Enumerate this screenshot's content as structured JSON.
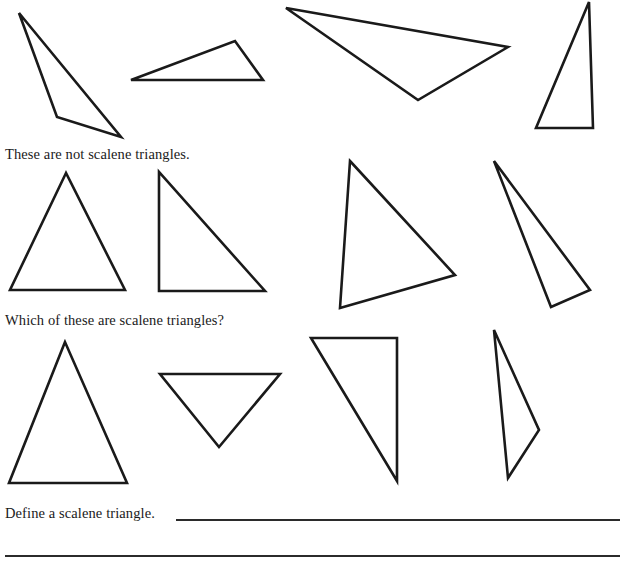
{
  "page": {
    "background_color": "#ffffff",
    "ink_color": "#1a1a1a",
    "width": 625,
    "height": 568
  },
  "prompts": {
    "not_scalene": "These are not scalene triangles.",
    "which_scalene": "Which of these are scalene triangles?",
    "define": "Define a scalene triangle."
  },
  "answer_lines": [
    {
      "name": "answer-rule-1",
      "x": 176,
      "y": 519,
      "width": 444
    },
    {
      "name": "answer-rule-2",
      "x": 5,
      "y": 555,
      "width": 615
    }
  ],
  "figures": {
    "stroke_color": "#1a1a1a",
    "stroke_width": 2.6,
    "fill": "none",
    "rows": [
      {
        "row_name": "row-not-scalene-examples",
        "caption": "These are not scalene triangles.",
        "triangles": [
          {
            "name": "triangle-row1-1",
            "kind": "obtuse-thin",
            "points": "19,13 57,117 121,137"
          },
          {
            "name": "triangle-row1-2",
            "kind": "obtuse-flat",
            "points": "131,80 235,41 263,80"
          },
          {
            "name": "triangle-row1-3",
            "kind": "obtuse-wide",
            "points": "286,8 508,47 418,100"
          },
          {
            "name": "triangle-row1-4",
            "kind": "right-tall",
            "points": "589,2 536,128 593,128"
          }
        ]
      },
      {
        "row_name": "row-which-scalene-upper",
        "caption": "Which of these are scalene triangles?",
        "triangles": [
          {
            "name": "triangle-row2-1",
            "kind": "isosceles",
            "points": "66,173 10,290 125,290"
          },
          {
            "name": "triangle-row2-2",
            "kind": "right",
            "points": "159,172 159,291 265,291"
          },
          {
            "name": "triangle-row2-3",
            "kind": "scalene",
            "points": "350,161 455,275 340,308"
          },
          {
            "name": "triangle-row2-4",
            "kind": "scalene-narrow",
            "points": "494,161 590,290 551,307"
          }
        ]
      },
      {
        "row_name": "row-which-scalene-lower",
        "caption": "",
        "triangles": [
          {
            "name": "triangle-row3-1",
            "kind": "isosceles-tall",
            "points": "65,342 9,483 127,483"
          },
          {
            "name": "triangle-row3-2",
            "kind": "isosceles-inverted",
            "points": "160,374 280,374 219,447"
          },
          {
            "name": "triangle-row3-3",
            "kind": "right",
            "points": "311,338 397,338 397,481"
          },
          {
            "name": "triangle-row3-4",
            "kind": "scalene-narrow",
            "points": "494,330 539,430 508,478"
          }
        ]
      }
    ]
  }
}
